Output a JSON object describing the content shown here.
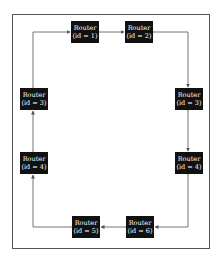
{
  "diagram": {
    "type": "ring-topology",
    "nodes": [
      {
        "key": "n1",
        "label": "Router",
        "id_text": "(id = 1)",
        "x": 71,
        "y": 21
      },
      {
        "key": "n2",
        "label": "Router",
        "id_text": "(id = 2)",
        "x": 125,
        "y": 21
      },
      {
        "key": "n3r",
        "label": "Router",
        "id_text": "(id = 3)",
        "x": 175,
        "y": 88
      },
      {
        "key": "n4r",
        "label": "Router",
        "id_text": "(id = 4)",
        "x": 175,
        "y": 152
      },
      {
        "key": "n6",
        "label": "Router",
        "id_text": "(id = 6)",
        "x": 126,
        "y": 216
      },
      {
        "key": "n5",
        "label": "Router",
        "id_text": "(id = 5)",
        "x": 72,
        "y": 216
      },
      {
        "key": "n4l",
        "label": "Router",
        "id_text": "(id = 4)",
        "x": 20,
        "y": 152
      },
      {
        "key": "n3l",
        "label": "Router",
        "id_text": "(id = 3)",
        "x": 20,
        "y": 88
      }
    ],
    "edges": [
      {
        "from": "(id = 1)",
        "to": "(id = 2)",
        "bidirectional": true
      },
      {
        "from": "(id = 2)",
        "to": "(id = 3)",
        "bidirectional": true
      },
      {
        "from": "(id = 3)",
        "to": "(id = 4)",
        "bidirectional": true
      },
      {
        "from": "(id = 4)",
        "to": "(id = 6)",
        "bidirectional": true
      },
      {
        "from": "(id = 6)",
        "to": "(id = 5)",
        "bidirectional": true
      },
      {
        "from": "(id = 5)",
        "to": "(id = 4)",
        "bidirectional": true
      },
      {
        "from": "(id = 4)",
        "to": "(id = 3)",
        "bidirectional": true
      },
      {
        "from": "(id = 3)",
        "to": "(id = 1)",
        "bidirectional": true
      }
    ],
    "colors": {
      "node_fill": "#111111",
      "node_text": "#ffffff",
      "edge": "#777777",
      "frame": "#555555"
    }
  }
}
